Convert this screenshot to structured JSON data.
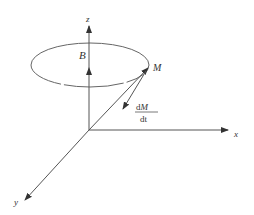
{
  "diagram": {
    "axes": {
      "x_label": "x",
      "y_label": "y",
      "z_label": "z"
    },
    "field_label": "B",
    "vector_label": "M",
    "derivative_label": {
      "numerator": "dM",
      "denominator": "dt",
      "numerator_prefix": "d",
      "numerator_var": "M",
      "denominator_text": "dt"
    },
    "colors": {
      "line": "#555555",
      "text": "#333333",
      "background": "#ffffff"
    }
  }
}
